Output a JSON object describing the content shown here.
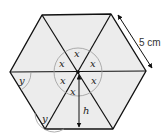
{
  "diagram": {
    "type": "regular-hexagon",
    "colors": {
      "fill": "#ececec",
      "stroke": "#111111",
      "arc": "#9a9a9a"
    },
    "side_length_label": "5 cm",
    "center_angle_labels": [
      "x",
      "x",
      "x",
      "x",
      "x",
      "x"
    ],
    "interior_angle_labels": [
      "y",
      "y"
    ],
    "height_label": "h"
  }
}
